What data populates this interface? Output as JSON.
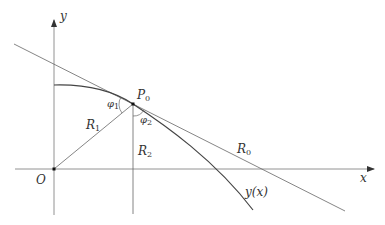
{
  "diagram": {
    "colors": {
      "line": "#555555",
      "curve": "#333333",
      "background": "#ffffff",
      "text": "#333333"
    },
    "axes": {
      "x_label": "x",
      "y_label": "y",
      "origin_label": "O"
    },
    "point": {
      "name": "P",
      "sub": "0"
    },
    "labels": {
      "R1": {
        "main": "R",
        "sub": "1"
      },
      "R2": {
        "main": "R",
        "sub": "2"
      },
      "R0": {
        "main": "R",
        "sub": "0"
      },
      "phi1": {
        "main": "φ",
        "sub": "1"
      },
      "phi2": {
        "main": "φ",
        "sub": "2"
      },
      "curve": "y(x)"
    }
  }
}
